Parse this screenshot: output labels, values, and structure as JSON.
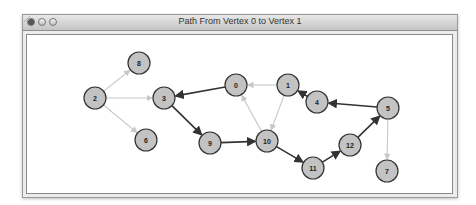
{
  "window": {
    "title": "Path From Vertex 0 to Vertex 1",
    "buttons": [
      "close",
      "minimize",
      "maximize"
    ]
  },
  "graph": {
    "node_fill": "#c3c3c3",
    "node_stroke": "#333333",
    "path_edge_color": "#333333",
    "other_edge_color": "#c8c8c8",
    "nodes": [
      {
        "id": "0",
        "x": 236,
        "y": 85
      },
      {
        "id": "1",
        "x": 288,
        "y": 85
      },
      {
        "id": "2",
        "x": 95,
        "y": 98
      },
      {
        "id": "3",
        "x": 164,
        "y": 98
      },
      {
        "id": "4",
        "x": 317,
        "y": 102
      },
      {
        "id": "5",
        "x": 388,
        "y": 108
      },
      {
        "id": "6",
        "x": 146,
        "y": 140
      },
      {
        "id": "7",
        "x": 387,
        "y": 171
      },
      {
        "id": "8",
        "x": 139,
        "y": 63
      },
      {
        "id": "9",
        "x": 210,
        "y": 143
      },
      {
        "id": "10",
        "x": 267,
        "y": 141
      },
      {
        "id": "11",
        "x": 313,
        "y": 168
      },
      {
        "id": "12",
        "x": 350,
        "y": 145
      }
    ],
    "edges": [
      {
        "from": "2",
        "to": "8",
        "path": false
      },
      {
        "from": "2",
        "to": "3",
        "path": false
      },
      {
        "from": "2",
        "to": "6",
        "path": false
      },
      {
        "from": "0",
        "to": "3",
        "path": true
      },
      {
        "from": "3",
        "to": "9",
        "path": true
      },
      {
        "from": "9",
        "to": "10",
        "path": true
      },
      {
        "from": "10",
        "to": "0",
        "path": false
      },
      {
        "from": "1",
        "to": "0",
        "path": false
      },
      {
        "from": "1",
        "to": "10",
        "path": false
      },
      {
        "from": "4",
        "to": "1",
        "path": true
      },
      {
        "from": "5",
        "to": "4",
        "path": true
      },
      {
        "from": "10",
        "to": "11",
        "path": true
      },
      {
        "from": "11",
        "to": "12",
        "path": true
      },
      {
        "from": "12",
        "to": "5",
        "path": true
      },
      {
        "from": "5",
        "to": "7",
        "path": false
      }
    ]
  }
}
